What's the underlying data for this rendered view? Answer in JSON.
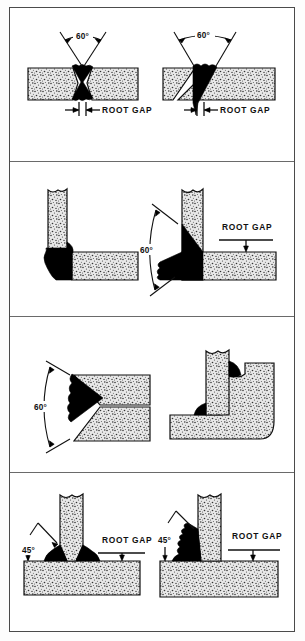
{
  "figure": {
    "background_color": "#ffffff",
    "border_color": "#4a4a4a",
    "metal_fill": "speckled-gray",
    "weld_fill": "#000000",
    "panel_count": 4
  },
  "panels": [
    {
      "id": "panel-1",
      "name": "butt-joints",
      "figures": [
        {
          "id": "fig-1a",
          "name": "double-v-butt-joint",
          "angle_label": "60°",
          "gap_label": "ROOT GAP",
          "orientation": "horizontal-plates",
          "weld_shape": "double-v"
        },
        {
          "id": "fig-1b",
          "name": "single-v-butt-joint",
          "angle_label": "60°",
          "gap_label": "ROOT GAP",
          "orientation": "horizontal-plates",
          "weld_shape": "single-v"
        }
      ]
    },
    {
      "id": "panel-2",
      "name": "corner-joints",
      "figures": [
        {
          "id": "fig-2a",
          "name": "corner-fillet-joint",
          "angle_label": "",
          "gap_label": "",
          "orientation": "vertical-and-horizontal-plate",
          "weld_shape": "outside-fillet"
        },
        {
          "id": "fig-2b",
          "name": "bevelled-corner-joint",
          "angle_label": "60°",
          "gap_label": "ROOT GAP",
          "orientation": "vertical-and-horizontal-plate",
          "weld_shape": "single-bevel-fillet"
        }
      ]
    },
    {
      "id": "panel-3",
      "name": "horizontal-butt-and-lap-joints",
      "figures": [
        {
          "id": "fig-3a",
          "name": "horizontal-single-v-butt-joint",
          "angle_label": "60°",
          "gap_label": "",
          "orientation": "stacked-plates",
          "weld_shape": "single-v-horizontal"
        },
        {
          "id": "fig-3b",
          "name": "plate-in-bent-corner-joint",
          "angle_label": "",
          "gap_label": "",
          "orientation": "vertical-plate-in-radiused-corner",
          "weld_shape": "two-small-fillets"
        }
      ]
    },
    {
      "id": "panel-4",
      "name": "tee-joints",
      "figures": [
        {
          "id": "fig-4a",
          "name": "double-bevel-tee-joint",
          "angle_label": "45°",
          "gap_label": "ROOT GAP",
          "orientation": "vertical-plate-on-base-plate",
          "weld_shape": "double-bevel"
        },
        {
          "id": "fig-4b",
          "name": "single-bevel-tee-joint",
          "angle_label": "45°",
          "gap_label": "ROOT GAP",
          "orientation": "vertical-plate-on-base-plate",
          "weld_shape": "single-bevel"
        }
      ]
    }
  ]
}
